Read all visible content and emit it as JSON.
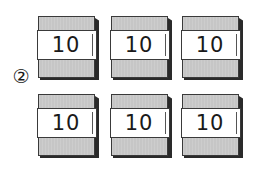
{
  "label": "②",
  "blocks": [
    {
      "value": "10",
      "row": 0,
      "col": 0
    },
    {
      "value": "10",
      "row": 0,
      "col": 1
    },
    {
      "value": "10",
      "row": 0,
      "col": 2
    },
    {
      "value": "10",
      "row": 1,
      "col": 0
    },
    {
      "value": "10",
      "row": 1,
      "col": 1
    },
    {
      "value": "10",
      "row": 1,
      "col": 2
    }
  ],
  "colors": {
    "band_gray": "#c6c6c6",
    "shadow": "#2a2a2a",
    "band_white": "#ffffff"
  }
}
